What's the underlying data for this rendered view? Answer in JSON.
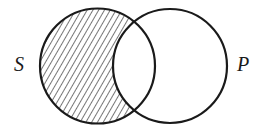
{
  "diagram": {
    "type": "venn",
    "sets": [
      {
        "label": "S",
        "cx": 97.5,
        "cy": 66,
        "r": 57.5,
        "shaded_region": "S minus P"
      },
      {
        "label": "P",
        "cx": 170,
        "cy": 66,
        "r": 57,
        "shaded_region": "none"
      }
    ],
    "stroke_color": "#1a1a1a",
    "hatch_color": "#1a1a1a",
    "background": "#ffffff"
  }
}
